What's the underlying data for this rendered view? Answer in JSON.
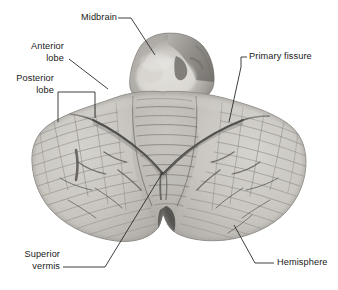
{
  "figure": {
    "width": 338,
    "height": 290,
    "background": "#ffffff",
    "text_color": "#1a1a1a",
    "leader_color": "#2b2b2b",
    "specimen_tone_light": "#d9d7d2",
    "specimen_tone_mid": "#b4b1ab",
    "specimen_tone_dark": "#6e6b66",
    "fissure_color": "#181818"
  },
  "labels": {
    "midbrain": "Midbrain",
    "anterior_lobe_line1": "Anterior",
    "anterior_lobe_line2": "lobe",
    "posterior_lobe_line1": "Posterior",
    "posterior_lobe_line2": "lobe",
    "primary_fissure": "Primary fissure",
    "superior_vermis_line1": "Superior",
    "superior_vermis_line2": "vermis",
    "hemisphere": "Hemisphere"
  },
  "structures": [
    {
      "name": "midbrain",
      "label": "Midbrain",
      "side": "top-center",
      "leader": "diagonal-down-right"
    },
    {
      "name": "anterior-lobe",
      "label": "Anterior lobe",
      "side": "left",
      "leader": "diagonal-down-right"
    },
    {
      "name": "posterior-lobe",
      "label": "Posterior lobe",
      "side": "left",
      "leader": "bracket"
    },
    {
      "name": "primary-fissure",
      "label": "Primary fissure",
      "side": "right",
      "leader": "elbow-down"
    },
    {
      "name": "superior-vermis",
      "label": "Superior vermis",
      "side": "bottom-left",
      "leader": "diagonal-up-right"
    },
    {
      "name": "hemisphere",
      "label": "Hemisphere",
      "side": "bottom-right",
      "leader": "diagonal-up-left"
    }
  ]
}
